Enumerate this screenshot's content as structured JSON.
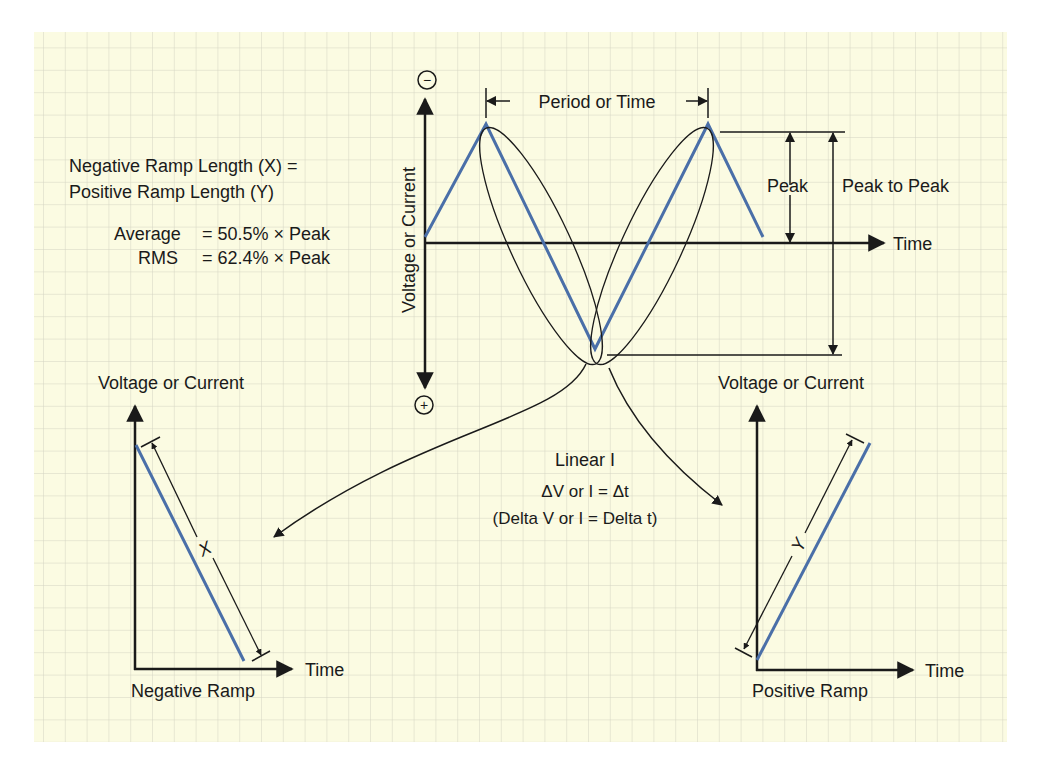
{
  "colors": {
    "paper": "#fbfbe2",
    "grid": "#d3d4c2",
    "waveform": "#4a6fa8",
    "ink": "#1a1a1a"
  },
  "main_diagram": {
    "y_axis_label": "Voltage or Current",
    "x_axis_label": "Time",
    "top_polarity_symbol": "−",
    "bottom_polarity_symbol": "+",
    "period_label": "Period or Time",
    "peak_label": "Peak",
    "peak_to_peak_label": "Peak to Peak"
  },
  "notes": {
    "line1": "Negative Ramp Length (X) =",
    "line2": "Positive Ramp Length (Y)",
    "average_label": "Average",
    "average_value": "= 50.5% × Peak",
    "rms_label": "RMS",
    "rms_value": "= 62.4% × Peak"
  },
  "center_text": {
    "line1": "Linear I",
    "line2": "ΔV or I = Δt",
    "line3": "(Delta V or I = Delta t)"
  },
  "negative_ramp": {
    "y_axis_label": "Voltage or Current",
    "x_axis_label": "Time",
    "caption": "Negative Ramp",
    "length_symbol": "X"
  },
  "positive_ramp": {
    "y_axis_label": "Voltage or Current",
    "x_axis_label": "Time",
    "caption": "Positive Ramp",
    "length_symbol": "Y"
  }
}
